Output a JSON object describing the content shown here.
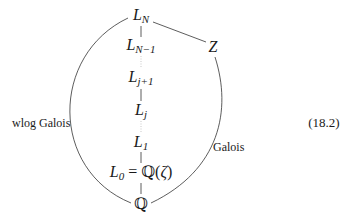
{
  "diagram": {
    "nodes": {
      "LN": {
        "base": "L",
        "sub": "N"
      },
      "LN1": {
        "base": "L",
        "sub": "N−1"
      },
      "Lj1": {
        "base": "L",
        "sub": "j+1"
      },
      "Lj": {
        "base": "L",
        "sub": "j"
      },
      "L1": {
        "base": "L",
        "sub": "1"
      },
      "L0": {
        "base": "L",
        "sub": "0",
        "rest": " = ℚ(",
        "zeta": "ζ",
        "close": ")"
      },
      "Q": {
        "text": "ℚ"
      },
      "Z": {
        "text": "Z"
      }
    },
    "edge_labels": {
      "left_arc": "wlog Galois",
      "right_arc": "Galois"
    },
    "equation_number": "(18.2)",
    "edges": [
      {
        "from": "LN",
        "to": "LN1",
        "style": "solid"
      },
      {
        "from": "LN1",
        "to": "Lj1",
        "style": "dotted"
      },
      {
        "from": "Lj1",
        "to": "Lj",
        "style": "solid"
      },
      {
        "from": "Lj",
        "to": "L1",
        "style": "dotted"
      },
      {
        "from": "L1",
        "to": "L0",
        "style": "solid"
      },
      {
        "from": "L0",
        "to": "Q",
        "style": "solid"
      },
      {
        "from": "LN",
        "to": "Z",
        "style": "solid"
      },
      {
        "from": "Z",
        "to": "Q",
        "style": "solid-curve",
        "label": "Galois"
      },
      {
        "from": "LN",
        "to": "Q",
        "style": "solid-curve",
        "label": "wlog Galois"
      }
    ]
  }
}
